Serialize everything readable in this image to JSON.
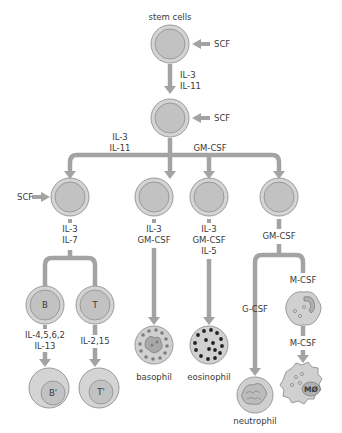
{
  "diagram": {
    "title_label": "stem cells",
    "colors": {
      "line": "#a3a3a3",
      "cell_outer": "#d4d4d4",
      "cell_inner": "#c2c2c2",
      "granule_dark": "#2a2a2a",
      "granule_light": "#8a8a8a"
    },
    "cells": {
      "stem": {
        "label": ""
      },
      "progenitor": {
        "label": ""
      },
      "lymphoid": {
        "label": ""
      },
      "baso_precursor": {
        "label": ""
      },
      "eos_precursor": {
        "label": ""
      },
      "myelo_precursor": {
        "label": ""
      },
      "b_cell": {
        "label": "B"
      },
      "t_cell": {
        "label": "T"
      },
      "b_activated": {
        "label": "B'"
      },
      "t_activated": {
        "label": "T'"
      },
      "basophil": {
        "label": "basophil"
      },
      "eosinophil": {
        "label": "eosinophil"
      },
      "neutrophil": {
        "label": "neutrophil"
      },
      "monocyte": {
        "label": ""
      },
      "macrophage": {
        "label": "MØ"
      }
    },
    "factors": {
      "scf_1": "SCF",
      "scf_2": "SCF",
      "scf_3": "SCF",
      "stem_to_prog_1": "IL-3",
      "stem_to_prog_2": "IL-11",
      "branch_left_1": "IL-3",
      "branch_left_2": "IL-11",
      "branch_right": "GM-CSF",
      "lymph_1": "IL-3",
      "lymph_2": "IL-7",
      "baso_1": "IL-3",
      "baso_2": "GM-CSF",
      "eos_1": "IL-3",
      "eos_2": "GM-CSF",
      "eos_3": "IL-5",
      "myelo": "GM-CSF",
      "b_1": "IL-4,5,6,2",
      "b_2": "IL-13",
      "t_1": "IL-2,15",
      "neut": "G-CSF",
      "mono_1": "M-CSF",
      "mono_2": "M-CSF"
    }
  }
}
